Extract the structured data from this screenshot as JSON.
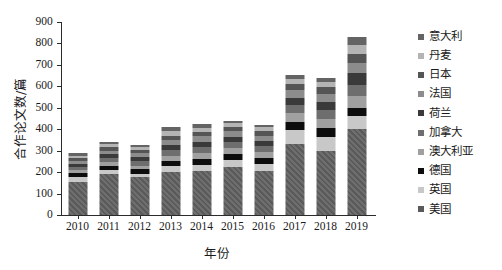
{
  "chart_data": {
    "type": "bar",
    "subtype": "stacked-bar",
    "title": "",
    "xlabel": "年份",
    "ylabel": "合作论文数/篇",
    "categories": [
      "2010",
      "2011",
      "2012",
      "2013",
      "2014",
      "2015",
      "2016",
      "2017",
      "2018",
      "2019"
    ],
    "ylim": [
      0,
      900
    ],
    "yticks": [
      0,
      100,
      200,
      300,
      400,
      500,
      600,
      700,
      800,
      900
    ],
    "ytick_labels": [
      "0",
      "100",
      "200",
      "300",
      "400",
      "500",
      "600",
      "700",
      "800",
      "900"
    ],
    "grid": false,
    "legend_position": "right",
    "stack_order_bottom_to_top": [
      "美国",
      "英国",
      "德国",
      "澳大利亚",
      "加拿大",
      "荷兰",
      "法国",
      "日本",
      "丹麦",
      "意大利"
    ],
    "series": [
      {
        "name": "美国",
        "color": "#5a5a5a",
        "pattern": "diagonal-hatch",
        "values": [
          155,
          192,
          175,
          200,
          205,
          222,
          205,
          330,
          300,
          400
        ]
      },
      {
        "name": "英国",
        "color": "#c8c8c8",
        "pattern": "solid",
        "values": [
          22,
          20,
          18,
          28,
          30,
          34,
          32,
          66,
          64,
          60
        ]
      },
      {
        "name": "德国",
        "color": "#0d0d0d",
        "pattern": "solid",
        "values": [
          20,
          18,
          22,
          25,
          28,
          30,
          30,
          40,
          42,
          40
        ]
      },
      {
        "name": "澳大利亚",
        "color": "#a0a0a0",
        "pattern": "solid",
        "values": [
          13,
          17,
          16,
          24,
          26,
          26,
          26,
          40,
          42,
          56
        ]
      },
      {
        "name": "加拿大",
        "color": "#6e6e6e",
        "pattern": "solid",
        "values": [
          14,
          18,
          20,
          24,
          28,
          28,
          28,
          36,
          40,
          52
        ]
      },
      {
        "name": "荷兰",
        "color": "#3a3a3a",
        "pattern": "solid",
        "values": [
          14,
          18,
          20,
          26,
          26,
          26,
          26,
          36,
          40,
          54
        ]
      },
      {
        "name": "法国",
        "color": "#8c8c8c",
        "pattern": "solid",
        "values": [
          14,
          16,
          18,
          24,
          24,
          24,
          24,
          34,
          36,
          48
        ]
      },
      {
        "name": "日本",
        "color": "#555555",
        "pattern": "solid",
        "values": [
          14,
          16,
          16,
          20,
          22,
          22,
          22,
          30,
          32,
          42
        ]
      },
      {
        "name": "丹麦",
        "color": "#b4b4b4",
        "pattern": "solid",
        "values": [
          11,
          14,
          12,
          19,
          18,
          18,
          17,
          24,
          24,
          40
        ]
      },
      {
        "name": "意大利",
        "color": "#646464",
        "pattern": "solid",
        "values": [
          11,
          11,
          10,
          20,
          18,
          10,
          10,
          19,
          20,
          38
        ]
      }
    ],
    "totals": [
      288,
      340,
      327,
      410,
      425,
      440,
      420,
      655,
      640,
      830
    ]
  },
  "legend": {
    "items": [
      {
        "label": "意大利"
      },
      {
        "label": "丹麦"
      },
      {
        "label": "日本"
      },
      {
        "label": "法国"
      },
      {
        "label": "荷兰"
      },
      {
        "label": "加拿大"
      },
      {
        "label": "澳大利亚"
      },
      {
        "label": "德国"
      },
      {
        "label": "英国"
      },
      {
        "label": "美国"
      }
    ]
  }
}
